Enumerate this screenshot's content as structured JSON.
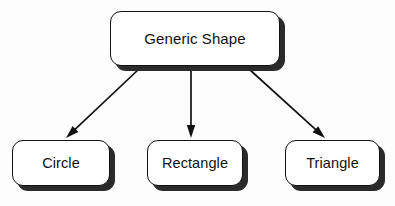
{
  "diagram": {
    "type": "inheritance-hierarchy",
    "background_color": "#fdfdfd",
    "line_color": "#111111",
    "shadow_color": "#2b2b2b",
    "box_fill_color": "#ffffff",
    "root": {
      "id": "generic-shape",
      "label": "Generic Shape",
      "x": 110,
      "y": 11,
      "width": 170,
      "height": 55
    },
    "children": [
      {
        "id": "circle",
        "label": "Circle",
        "x": 12,
        "y": 140,
        "width": 98,
        "height": 46
      },
      {
        "id": "rectangle",
        "label": "Rectangle",
        "x": 147,
        "y": 140,
        "width": 96,
        "height": 46
      },
      {
        "id": "triangle",
        "label": "Triangle",
        "x": 285,
        "y": 140,
        "width": 95,
        "height": 46
      }
    ],
    "edges": [
      {
        "id": "edge-generic-shape-to-circle",
        "from": "generic-shape",
        "to": "circle",
        "arrowhead": "solid-filled-triangle",
        "x1": 139,
        "y1": 69,
        "x2": 66,
        "y2": 138
      },
      {
        "id": "edge-generic-shape-to-rectangle",
        "from": "generic-shape",
        "to": "rectangle",
        "arrowhead": "solid-filled-triangle",
        "x1": 191,
        "y1": 69,
        "x2": 191,
        "y2": 138
      },
      {
        "id": "edge-generic-shape-to-triangle",
        "from": "generic-shape",
        "to": "triangle",
        "arrowhead": "solid-filled-triangle",
        "x1": 249,
        "y1": 69,
        "x2": 325,
        "y2": 138
      }
    ],
    "shadow_offset": {
      "x": 5,
      "y": 5
    }
  }
}
